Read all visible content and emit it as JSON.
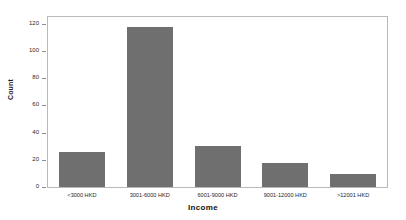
{
  "chart_data": {
    "type": "bar",
    "title": "",
    "xlabel": "Income",
    "ylabel": "Count",
    "categories": [
      "<3000 HKD",
      "3001-6000 HKD",
      "6001-9000 HKD",
      "9001-12000 HKD",
      ">12001 HKD"
    ],
    "values": [
      26,
      118,
      30,
      17.5,
      9.5
    ],
    "ylim": [
      0,
      125
    ],
    "yticks": [
      0,
      20,
      40,
      60,
      80,
      100,
      120
    ],
    "ytick_labels": [
      "0",
      "20",
      "40",
      "60",
      "80",
      "100",
      "120"
    ],
    "grid": false,
    "legend": null,
    "bar_color": "#6f6f6f",
    "frame_color": "#b9b9b9",
    "background": "#ffffff"
  }
}
